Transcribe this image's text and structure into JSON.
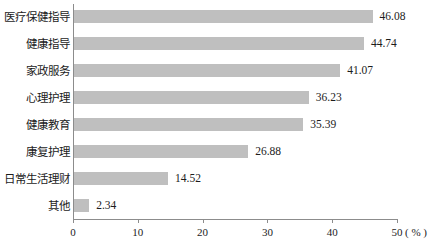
{
  "chart_data": {
    "type": "bar",
    "orientation": "horizontal",
    "title": "",
    "subtitle": "",
    "xlabel": "%",
    "ylabel": "",
    "xlim": [
      0,
      50
    ],
    "grid": false,
    "legend": null,
    "xticks": [
      "0",
      "10",
      "20",
      "30",
      "40",
      "50"
    ],
    "xtick_values": [
      0,
      10,
      20,
      30,
      40,
      50
    ],
    "axis_unit": "( % )",
    "bar_color": "#bfbfbf",
    "axis_color": "#8c8c8c",
    "text_color": "#1c1c1c",
    "categories": [
      "医疗保健指导",
      "健康指导",
      "家政服务",
      "心理护理",
      "健康教育",
      "康复护理",
      "日常生活理财",
      "其他"
    ],
    "values": [
      46.08,
      44.74,
      41.07,
      36.23,
      35.39,
      26.88,
      14.52,
      2.34
    ],
    "value_labels": [
      "46.08",
      "44.74",
      "41.07",
      "36.23",
      "35.39",
      "26.88",
      "14.52",
      "2.34"
    ]
  }
}
